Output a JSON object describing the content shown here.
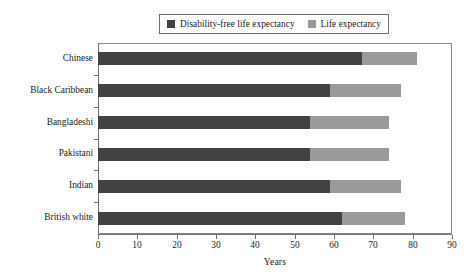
{
  "chart_data": {
    "type": "bar",
    "orientation": "horizontal",
    "stacked": true,
    "title": "",
    "xlabel": "Years",
    "ylabel": "",
    "xlim": [
      0,
      90
    ],
    "xticks": [
      0,
      10,
      20,
      30,
      40,
      50,
      60,
      70,
      80,
      90
    ],
    "grid": false,
    "legend_position": "top-center",
    "categories": [
      "Chinese",
      "Black Caribbean",
      "Bangladeshi",
      "Pakistani",
      "Indian",
      "British white"
    ],
    "series": [
      {
        "name": "Disability-free life expectancy",
        "color": "#434343",
        "values": [
          67,
          59,
          54,
          54,
          59,
          62
        ]
      },
      {
        "name": "Life expectancy",
        "color": "#9a9a9a",
        "values": [
          81,
          77,
          74,
          74,
          77,
          78
        ]
      }
    ]
  },
  "legend": {
    "entries": [
      {
        "label": "Disability-free life expectancy",
        "color": "#434343"
      },
      {
        "label": "Life expectancy",
        "color": "#9a9a9a"
      }
    ]
  },
  "axes": {
    "x_title": "Years",
    "x_tick_labels": [
      "0",
      "10",
      "20",
      "30",
      "40",
      "50",
      "60",
      "70",
      "80",
      "90"
    ],
    "y_tick_labels": [
      "Chinese",
      "Black Caribbean",
      "Bangladeshi",
      "Pakistani",
      "Indian",
      "British white"
    ]
  },
  "colors": {
    "series_dark": "#434343",
    "series_light": "#9a9a9a",
    "frame": "#8a8a8a",
    "axis": "#707070"
  }
}
